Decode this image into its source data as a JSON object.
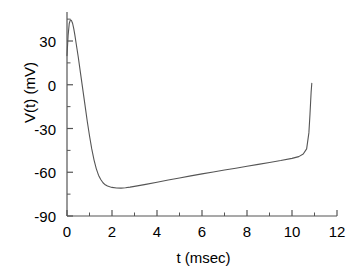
{
  "chart_data": {
    "type": "line",
    "title": "",
    "xlabel": "t (msec)",
    "ylabel": "V(t) (mV)",
    "xlim": [
      0,
      12
    ],
    "ylim": [
      -90,
      45
    ],
    "xticks": [
      0,
      2,
      4,
      6,
      8,
      10,
      12
    ],
    "xtick_labels": [
      "0",
      "2",
      "4",
      "6",
      "8",
      "10",
      "12"
    ],
    "x_minor_interval": 1,
    "yticks": [
      30,
      0,
      -30,
      -60,
      -90
    ],
    "ytick_labels": [
      "30",
      "0",
      "-30",
      "-60",
      "-90"
    ],
    "y_minor_interval": 15,
    "grid": false,
    "legend": null,
    "line_color": "#555555",
    "axis_color": "#555555",
    "background": "#ffffff",
    "series": [
      {
        "name": "V(t)",
        "x": [
          0.0,
          0.05,
          0.1,
          0.15,
          0.2,
          0.25,
          0.3,
          0.35,
          0.4,
          0.5,
          0.6,
          0.7,
          0.8,
          0.9,
          1.0,
          1.1,
          1.2,
          1.3,
          1.4,
          1.5,
          1.6,
          1.7,
          1.8,
          1.9,
          2.0,
          2.2,
          2.4,
          2.6,
          2.8,
          3.0,
          3.5,
          4.0,
          4.5,
          5.0,
          5.5,
          6.0,
          6.5,
          7.0,
          7.5,
          8.0,
          8.5,
          9.0,
          9.5,
          10.0,
          10.3,
          10.5,
          10.65,
          10.75,
          10.8,
          10.85,
          10.88
        ],
        "y": [
          20.0,
          34.0,
          42.0,
          44.5,
          44.0,
          42.0,
          38.5,
          34.0,
          29.0,
          19.0,
          8.0,
          -3.0,
          -14.0,
          -25.0,
          -35.0,
          -44.0,
          -51.5,
          -57.5,
          -62.0,
          -65.0,
          -67.2,
          -68.6,
          -69.5,
          -70.0,
          -70.4,
          -70.8,
          -70.9,
          -70.6,
          -70.2,
          -69.7,
          -68.3,
          -66.8,
          -65.3,
          -63.9,
          -62.5,
          -61.1,
          -59.8,
          -58.5,
          -57.2,
          -55.9,
          -54.6,
          -53.3,
          -52.0,
          -50.5,
          -49.3,
          -47.5,
          -44.0,
          -33.0,
          -20.0,
          -5.0,
          1.0
        ]
      }
    ]
  },
  "axes": {
    "x_axis_name": "t (msec)",
    "y_axis_name": "V(t) (mV)"
  }
}
